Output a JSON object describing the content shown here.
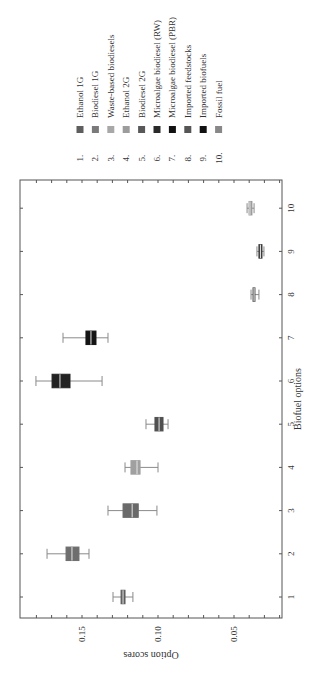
{
  "chart_data": {
    "type": "box",
    "orientation_note": "figure rotated 90 degrees clockwise on page",
    "title": "",
    "xlabel": "Biofuel options",
    "ylabel": "Option scores",
    "categories": [
      "1",
      "2",
      "3",
      "4",
      "5",
      "6",
      "7",
      "8",
      "9",
      "10"
    ],
    "ylim": [
      0.02,
      0.19
    ],
    "yticks": [
      0.05,
      0.1,
      0.15
    ],
    "ytick_labels": [
      "0.05",
      "0.10",
      "0.15"
    ],
    "grid": false,
    "legend_position": "top (rotated: right of plot)",
    "series": [
      {
        "id": 1,
        "name": "Ethanol 1G",
        "color": "#5e5e5e",
        "whisker_low": 0.1165,
        "q1": 0.1217,
        "median": 0.123,
        "q3": 0.1243,
        "whisker_high": 0.1296
      },
      {
        "id": 2,
        "name": "Biodiesel 1G",
        "color": "#6e6e6e",
        "whisker_low": 0.1454,
        "q1": 0.152,
        "median": 0.1566,
        "q3": 0.1605,
        "whisker_high": 0.173
      },
      {
        "id": 3,
        "name": "Waste-based biodiesels",
        "color": "#6a6a6a",
        "whisker_low": 0.1007,
        "q1": 0.113,
        "median": 0.117,
        "q3": 0.123,
        "whisker_high": 0.1329
      },
      {
        "id": 4,
        "name": "Ethanol 2G",
        "color": "#a0a0a0",
        "whisker_low": 0.1,
        "q1": 0.1118,
        "median": 0.1138,
        "q3": 0.1178,
        "whisker_high": 0.1217
      },
      {
        "id": 5,
        "name": "Biodiesel 2G",
        "color": "#505050",
        "whisker_low": 0.0934,
        "q1": 0.0967,
        "median": 0.0993,
        "q3": 0.102,
        "whisker_high": 0.1079
      },
      {
        "id": 6,
        "name": "Microalgae biodiesel (RW)",
        "color": "#222222",
        "whisker_low": 0.1368,
        "q1": 0.1579,
        "median": 0.1645,
        "q3": 0.1697,
        "whisker_high": 0.1803
      },
      {
        "id": 7,
        "name": "Microalgae biodiesel (PBR)",
        "color": "#141414",
        "whisker_low": 0.1329,
        "q1": 0.1408,
        "median": 0.1441,
        "q3": 0.1474,
        "whisker_high": 0.1625
      },
      {
        "id": 8,
        "name": "Imported feedstocks",
        "color": "#585858",
        "whisker_low": 0.0336,
        "q1": 0.0362,
        "median": 0.0368,
        "q3": 0.0375,
        "whisker_high": 0.0388
      },
      {
        "id": 9,
        "name": "Imported biofuels",
        "color": "#3a3a3a",
        "whisker_low": 0.0303,
        "q1": 0.0316,
        "median": 0.0326,
        "q3": 0.0336,
        "whisker_high": 0.0349
      },
      {
        "id": 10,
        "name": "Fossil fuel",
        "color": "#9a9a9a",
        "whisker_low": 0.0368,
        "q1": 0.0382,
        "median": 0.0395,
        "q3": 0.0401,
        "whisker_high": 0.0414
      }
    ]
  },
  "legend": {
    "items": [
      {
        "num": "1.",
        "label": "Ethanol 1G",
        "color": "#5e5e5e"
      },
      {
        "num": "2.",
        "label": "Biodiesel 1G",
        "color": "#7a7a7a"
      },
      {
        "num": "3.",
        "label": "Waste-based biodiesels",
        "color": "#a8a8a8"
      },
      {
        "num": "4.",
        "label": "Ethanol 2G",
        "color": "#9c9c9c"
      },
      {
        "num": "5.",
        "label": "Biodiesel 2G",
        "color": "#585858"
      },
      {
        "num": "6.",
        "label": "Microalgae biodiesel (RW)",
        "color": "#2a2a2a"
      },
      {
        "num": "7.",
        "label": "Microalgae biodiesel (PBR)",
        "color": "#111111"
      },
      {
        "num": "8.",
        "label": "Imported feedstocks",
        "color": "#555555"
      },
      {
        "num": "9.",
        "label": "Imported biofuels",
        "color": "#111111"
      },
      {
        "num": "10.",
        "label": "Fossil fuel",
        "color": "#888888"
      }
    ]
  }
}
